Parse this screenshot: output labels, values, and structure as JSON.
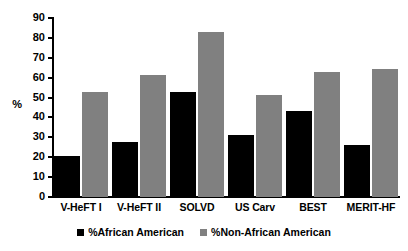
{
  "chart_data": {
    "type": "bar",
    "title": "",
    "subtitle": "",
    "xlabel": "",
    "ylabel": "%",
    "ylim": [
      0,
      90
    ],
    "yticks": [
      0,
      10,
      20,
      30,
      40,
      50,
      60,
      70,
      80,
      90
    ],
    "ytick_labels": [
      "0",
      "10",
      "20",
      "30",
      "40",
      "50",
      "60",
      "70",
      "80",
      "90"
    ],
    "grid": false,
    "legend_position": "bottom",
    "categories": [
      "V-HeFT I",
      "V-HeFT II",
      "SOLVD",
      "US Carv",
      "BEST",
      "MERIT-HF"
    ],
    "series": [
      {
        "name": "%African American",
        "color": "#000000",
        "values": [
          20.8,
          27.8,
          52.8,
          31.4,
          43.0,
          26.4
        ]
      },
      {
        "name": "%Non-African American",
        "color": "#808080",
        "values": [
          52.7,
          61.5,
          82.9,
          51.3,
          62.8,
          64.5
        ]
      }
    ],
    "annotations": []
  },
  "legend": {
    "items": [
      {
        "label": "%African American",
        "color": "#000000",
        "swatch_name": "legend-swatch-african-american"
      },
      {
        "label": "%Non-African American",
        "color": "#808080",
        "swatch_name": "legend-swatch-non-african-american"
      }
    ]
  },
  "colors": {
    "series_black": "#000000",
    "series_gray": "#808080",
    "axis": "#000000",
    "background": "#ffffff"
  }
}
